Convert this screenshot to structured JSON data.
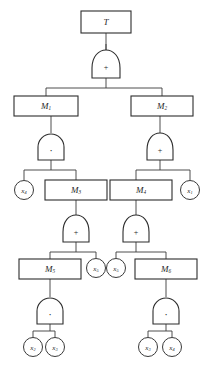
{
  "diagram": {
    "kind": "fault-tree",
    "title": "T",
    "colors": {
      "background": "#ffffff",
      "stroke": "#2c2c2c",
      "wire": "#3a3a3a",
      "text": "#1f1f1f"
    },
    "boxes": [
      {
        "id": "T",
        "label": "T",
        "sub": "",
        "x": 106,
        "y": 22,
        "w": 50,
        "h": 22
      },
      {
        "id": "M1",
        "label": "M",
        "sub": "1",
        "x": 46,
        "y": 106,
        "w": 64,
        "h": 20
      },
      {
        "id": "M2",
        "label": "M",
        "sub": "2",
        "x": 162,
        "y": 106,
        "w": 62,
        "h": 20
      },
      {
        "id": "M3",
        "label": "M",
        "sub": "3",
        "x": 76,
        "y": 190,
        "w": 62,
        "h": 20
      },
      {
        "id": "M4",
        "label": "M",
        "sub": "4",
        "x": 141,
        "y": 190,
        "w": 62,
        "h": 20
      },
      {
        "id": "M5",
        "label": "M",
        "sub": "5",
        "x": 50,
        "y": 269,
        "w": 62,
        "h": 20
      },
      {
        "id": "M6",
        "label": "M",
        "sub": "6",
        "x": 166,
        "y": 269,
        "w": 62,
        "h": 20
      }
    ],
    "gates": [
      {
        "id": "g-top",
        "type": "or",
        "symbol": "+",
        "x": 106,
        "y": 64,
        "parent": "T",
        "children": [
          "M1",
          "M2"
        ]
      },
      {
        "id": "g-m1",
        "type": "and",
        "symbol": "·",
        "x": 51,
        "y": 147,
        "parent": "M1",
        "children": [
          "x4-left",
          "M3"
        ]
      },
      {
        "id": "g-m2",
        "type": "or",
        "symbol": "+",
        "x": 160,
        "y": 147,
        "parent": "M2",
        "children": [
          "M4",
          "x1-right"
        ]
      },
      {
        "id": "g-m3",
        "type": "or",
        "symbol": "+",
        "x": 76,
        "y": 229,
        "parent": "M3",
        "children": [
          "M5",
          "x5-mid-left"
        ]
      },
      {
        "id": "g-m4",
        "type": "or",
        "symbol": "+",
        "x": 136,
        "y": 229,
        "parent": "M4",
        "children": [
          "x5-mid-right",
          "M6"
        ]
      },
      {
        "id": "g-m5",
        "type": "and",
        "symbol": "·",
        "x": 50,
        "y": 311,
        "parent": "M5",
        "children": [
          "x2-bot",
          "x3-bot"
        ]
      },
      {
        "id": "g-m6",
        "type": "and",
        "symbol": "·",
        "x": 166,
        "y": 311,
        "parent": "M6",
        "children": [
          "x3-bot2",
          "x4-bot"
        ]
      }
    ],
    "nodes": [
      {
        "id": "x4-left",
        "label": "x",
        "sub": "4",
        "x": 24,
        "y": 190,
        "r": 9.5
      },
      {
        "id": "x1-right",
        "label": "x",
        "sub": "1",
        "x": 190,
        "y": 190,
        "r": 9.5
      },
      {
        "id": "x5-mid-left",
        "label": "x",
        "sub": "5",
        "x": 96,
        "y": 268,
        "r": 9.5
      },
      {
        "id": "x5-mid-right",
        "label": "x",
        "sub": "5",
        "x": 116,
        "y": 268,
        "r": 9.5
      },
      {
        "id": "x2-bot",
        "label": "x",
        "sub": "2",
        "x": 33,
        "y": 347,
        "r": 9.5
      },
      {
        "id": "x3-bot",
        "label": "x",
        "sub": "3",
        "x": 55,
        "y": 347,
        "r": 9.5
      },
      {
        "id": "x3-bot2",
        "label": "x",
        "sub": "3",
        "x": 148,
        "y": 347,
        "r": 9.5
      },
      {
        "id": "x4-bot",
        "label": "x",
        "sub": "4",
        "x": 172,
        "y": 347,
        "r": 9.5
      }
    ],
    "gate_legend": {
      "or_symbol": "+",
      "and_symbol": "·"
    }
  }
}
